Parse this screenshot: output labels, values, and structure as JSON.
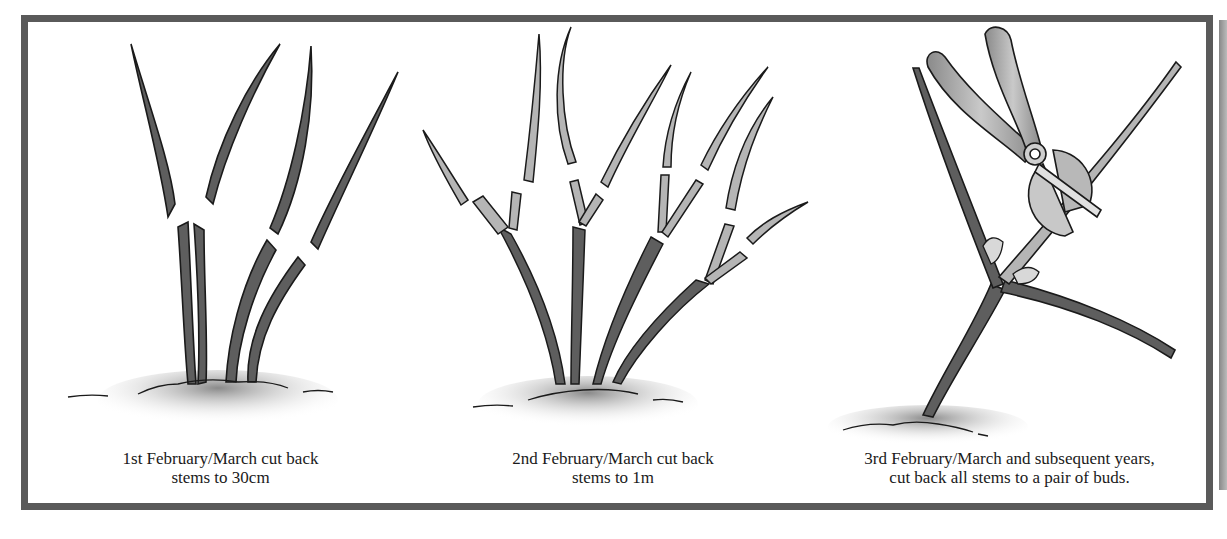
{
  "figure": {
    "frame_color": "#5a5a5a",
    "stem_dark": "#5e5e5e",
    "stem_light": "#b5b5b5",
    "outline": "#1a1a1a",
    "panels": [
      {
        "id": "year1",
        "caption_line1": "1st February/March cut back",
        "caption_line2": "stems to 30cm",
        "illustration": "five-stems-cut-at-30cm"
      },
      {
        "id": "year2",
        "caption_line1": "2nd February/March cut back",
        "caption_line2": "stems to 1m",
        "illustration": "branched-stems-cut-at-1m"
      },
      {
        "id": "year3",
        "caption_line1": "3rd February/March and subsequent years,",
        "caption_line2": "cut back all stems to a pair of buds.",
        "illustration": "secateurs-cutting-above-pair-of-buds"
      }
    ]
  }
}
